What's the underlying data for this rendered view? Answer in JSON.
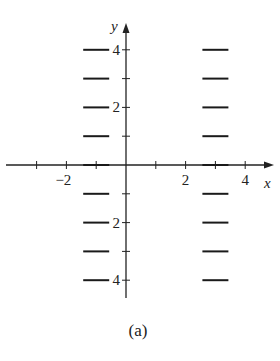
{
  "figure": {
    "caption": "(a)",
    "axes": {
      "x_label": "x",
      "y_label": "y",
      "x_tick_labels": [
        {
          "value": -2,
          "text": "−2"
        },
        {
          "value": 2,
          "text": "2"
        },
        {
          "value": 4,
          "text": "4"
        }
      ],
      "y_tick_labels": [
        {
          "value": 4,
          "text": "4"
        },
        {
          "value": 2,
          "text": "2"
        },
        {
          "value": -2,
          "text": "2"
        },
        {
          "value": -4,
          "text": "4"
        }
      ],
      "x_ticks": [
        -3,
        -2,
        -1,
        1,
        2,
        3,
        4
      ],
      "y_ticks": [
        4,
        3,
        2,
        1,
        -1,
        -2,
        -3,
        -4
      ]
    },
    "slope_field": {
      "description": "Horizontal slope segments (slope 0) at x = -1 and x = 3",
      "columns_x": [
        -1,
        3
      ],
      "rows_y": [
        4,
        3,
        2,
        1,
        0,
        -1,
        -2,
        -3,
        -4
      ],
      "slope": 0
    }
  }
}
